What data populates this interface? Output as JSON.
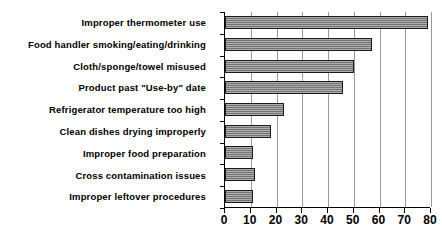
{
  "chart_data": {
    "type": "bar",
    "orientation": "horizontal",
    "title": "",
    "subtitle": "",
    "xlabel": "",
    "ylabel": "",
    "xlim": [
      0,
      80
    ],
    "xticks": [
      0,
      10,
      20,
      30,
      40,
      50,
      60,
      70,
      80
    ],
    "grid": "vertical",
    "legend": "none",
    "bar_color": "#8a8a8a",
    "bar_border_color": "#1a1a1a",
    "categories": [
      "Improper thermometer use",
      "Food handler smoking/eating/drinking",
      "Cloth/sponge/towel misused",
      "Product past \"Use-by\" date",
      "Refrigerator temperature too high",
      "Clean dishes drying improperly",
      "Improper food preparation",
      "Cross contamination issues",
      "Improper leftover procedures"
    ],
    "values": [
      79,
      57,
      50,
      46,
      23,
      18,
      11,
      11.5,
      11
    ]
  }
}
